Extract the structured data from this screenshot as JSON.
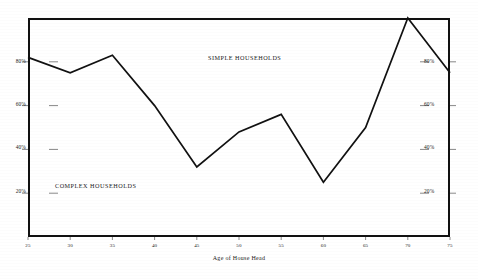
{
  "chart_data": {
    "type": "line",
    "title": "",
    "subtitle": "",
    "xlabel": "Age of House Head",
    "ylabel": "",
    "x": [
      25,
      30,
      35,
      40,
      45,
      50,
      55,
      60,
      65,
      70,
      75
    ],
    "xlim": [
      25,
      75
    ],
    "ylim": [
      0,
      100
    ],
    "grid": false,
    "legend_position": "in-plot annotations",
    "x_tick_labels": [
      "25",
      "30",
      "35",
      "40",
      "45",
      "50",
      "55",
      "60",
      "65",
      "70",
      "75"
    ],
    "y_tick_values": [
      20,
      40,
      60,
      80
    ],
    "y_tick_labels_left": [
      "20%",
      "40%",
      "60%",
      "80%"
    ],
    "y_tick_labels_right": [
      "20%",
      "40%",
      "60%",
      "80%"
    ],
    "series": [
      {
        "name": "Simple Households",
        "values": [
          82,
          75,
          83,
          60,
          32,
          48,
          56,
          25,
          50,
          100,
          75
        ],
        "color": "#111111"
      }
    ],
    "annotations": [
      {
        "id": "simple-households",
        "text": "SIMPLE HOUSEHOLDS",
        "x_px": 250,
        "y_px": 58
      },
      {
        "id": "complex-households",
        "text": "COMPLEX HOUSEHOLDS",
        "x_px": 100,
        "y_px": 186
      }
    ]
  },
  "axis": {
    "x_title": "Age of House Head",
    "x_ticks": [
      "25",
      "30",
      "35",
      "40",
      "45",
      "50",
      "55",
      "60",
      "65",
      "70",
      "75"
    ],
    "y_ticks_left": [
      "80%",
      "60%",
      "40%",
      "20%"
    ],
    "y_ticks_right": [
      "80%",
      "60%",
      "40%",
      "20%"
    ]
  },
  "labels": {
    "simple": "SIMPLE HOUSEHOLDS",
    "complex": "COMPLEX HOUSEHOLDS"
  },
  "colors": {
    "line": "#111111",
    "frame": "#111111",
    "text": "#1a1a1a",
    "background": "#ffffff"
  }
}
